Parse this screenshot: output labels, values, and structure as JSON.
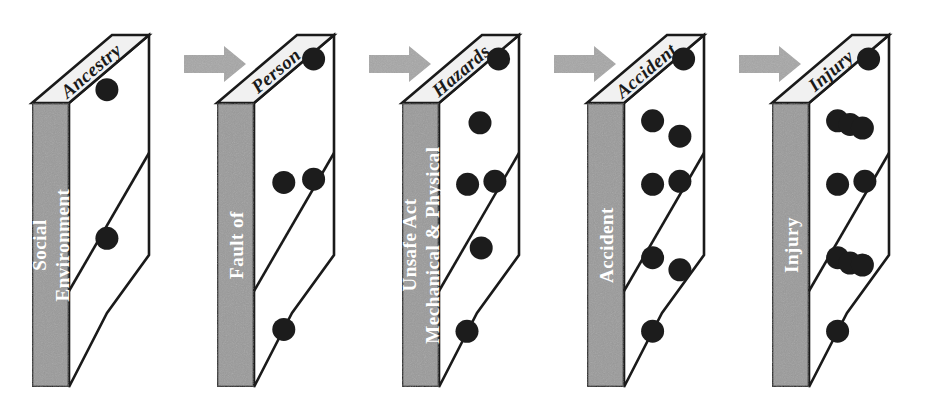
{
  "diagram": {
    "type": "process-sequence",
    "colors": {
      "front_face": "#9a9a9a",
      "top_face": "#f1f1f1",
      "side_face": "#ffffff",
      "outline": "#1a1a1a",
      "dot": "#1c1c1c",
      "arrow": "#a6a6a6",
      "front_text": "#ffffff",
      "top_text": "#1a1a1a",
      "background": "#ffffff"
    },
    "arrow_count": 4,
    "arrow_icon": "right-arrow-icon",
    "dominoes": [
      {
        "index": 1,
        "top_label": "Ancestry",
        "front_label_lines": [
          "Social",
          "Environment"
        ],
        "dot_count": 2,
        "dots_above_divider": 1,
        "dots_below_divider": 1
      },
      {
        "index": 2,
        "top_label": "Person",
        "front_label_lines": [
          "Fault of"
        ],
        "dot_count": 4,
        "dots_above_divider": 1,
        "dots_below_divider": 3
      },
      {
        "index": 3,
        "top_label": "Hazards",
        "front_label_lines": [
          "Unsafe Act",
          "Mechanical & Physical"
        ],
        "dot_count": 6,
        "dots_above_divider": 2,
        "dots_below_divider": 4
      },
      {
        "index": 4,
        "top_label": "Accident",
        "front_label_lines": [
          "Accident"
        ],
        "dot_count": 8,
        "dots_above_divider": 3,
        "dots_below_divider": 5
      },
      {
        "index": 5,
        "top_label": "Injury",
        "front_label_lines": [
          "Injury"
        ],
        "dot_count": 10,
        "dots_above_divider": 4,
        "dots_below_divider": 6
      }
    ]
  }
}
